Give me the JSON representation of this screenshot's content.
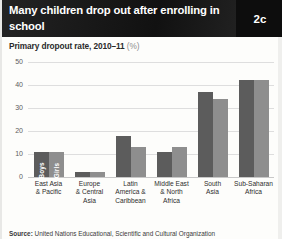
{
  "header": {
    "title": "Many children drop out after enrolling in school",
    "badge": "2c"
  },
  "subtitle": {
    "text": "Primary dropout rate, 2010–11",
    "unit": "(%)"
  },
  "source": {
    "label": "Source:",
    "text": " United Nations Educational, Scientific and Cultural Organization"
  },
  "chart_data": {
    "type": "bar",
    "title": "Many children drop out after enrolling in school",
    "subtitle": "Primary dropout rate, 2010–11 (%)",
    "xlabel": "",
    "ylabel": "",
    "ylim": [
      0,
      50
    ],
    "yticks": [
      0,
      10,
      20,
      30,
      40,
      50
    ],
    "ytick_labels": [
      "0",
      "10",
      "20",
      "30",
      "40",
      "50"
    ],
    "grid": true,
    "legend_position": "in-bar-labels",
    "categories": [
      "East Asia & Pacific",
      "Europe & Central Asia",
      "Latin America & Caribbean",
      "Middle East & North Africa",
      "South Asia",
      "Sub-Saharan Africa"
    ],
    "category_lines": [
      [
        "East Asia",
        "& Pacific"
      ],
      [
        "Europe",
        "& Central",
        "Asia"
      ],
      [
        "Latin",
        "America &",
        "Caribbean"
      ],
      [
        "Middle East",
        "& North",
        "Africa"
      ],
      [
        "South",
        "Asia"
      ],
      [
        "Sub-Saharan",
        "Africa"
      ]
    ],
    "series": [
      {
        "name": "Boys",
        "color": "#5c5c5c",
        "values": [
          11,
          2,
          18,
          11,
          37,
          42
        ]
      },
      {
        "name": "Girls",
        "color": "#8e8e8e",
        "values": [
          11,
          2,
          13,
          13,
          34,
          42
        ]
      }
    ]
  }
}
